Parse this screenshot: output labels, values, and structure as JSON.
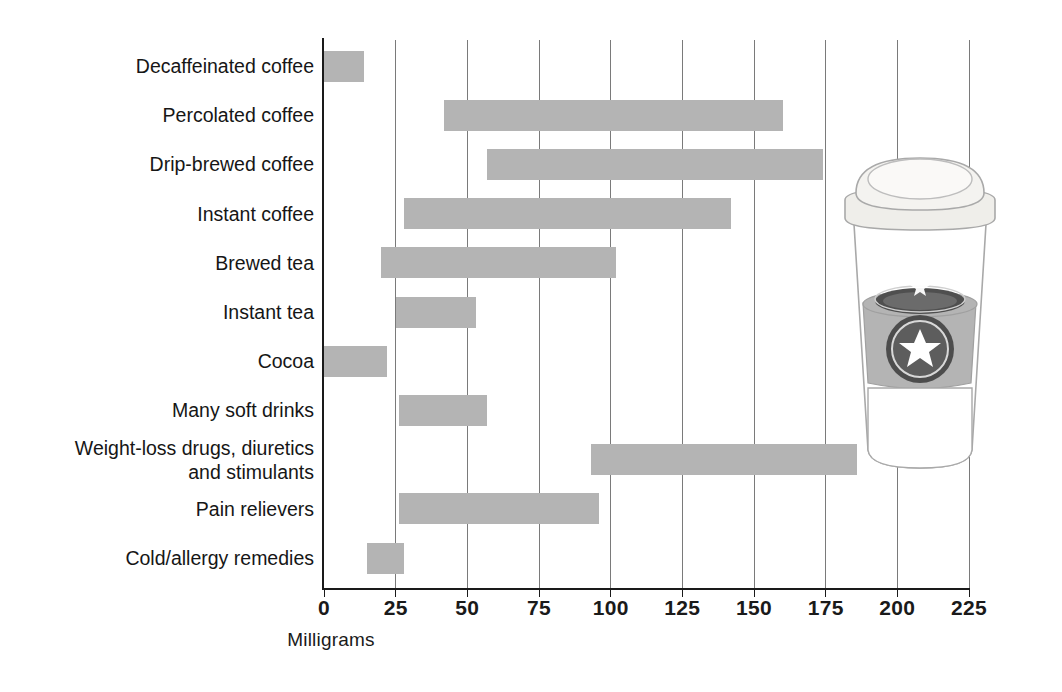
{
  "chart_data": {
    "type": "bar",
    "orientation": "horizontal",
    "subtype": "range-bar",
    "title": "",
    "xlabel": "Milligrams",
    "ylabel": "",
    "xlim": [
      0,
      232
    ],
    "xticks": [
      0,
      25,
      50,
      75,
      100,
      125,
      150,
      175,
      200,
      225
    ],
    "xtick_labels": [
      "0",
      "25",
      "50",
      "75",
      "100",
      "125",
      "150",
      "175",
      "200",
      "225"
    ],
    "grid": "vertical",
    "legend": "none",
    "bar_color": "#b4b4b4",
    "axis_color": "#1a1a1a",
    "grid_color": "#7a7a7a",
    "categories": [
      "Decaffeinated coffee",
      "Percolated coffee",
      "Drip-brewed coffee",
      "Instant coffee",
      "Brewed tea",
      "Instant tea",
      "Cocoa",
      "Many soft drinks",
      "Weight-loss drugs, diuretics\nand stimulants",
      "Pain relievers",
      "Cold/allergy remedies"
    ],
    "ranges": [
      {
        "label": "Decaffeinated coffee",
        "low": 0,
        "high": 14
      },
      {
        "label": "Percolated coffee",
        "low": 42,
        "high": 160
      },
      {
        "label": "Drip-brewed coffee",
        "low": 57,
        "high": 174
      },
      {
        "label": "Instant coffee",
        "low": 28,
        "high": 142
      },
      {
        "label": "Brewed tea",
        "low": 20,
        "high": 102
      },
      {
        "label": "Instant tea",
        "low": 25,
        "high": 53
      },
      {
        "label": "Cocoa",
        "low": 0,
        "high": 22
      },
      {
        "label": "Many soft drinks",
        "low": 26,
        "high": 57
      },
      {
        "label": "Weight-loss drugs, diuretics and stimulants",
        "low": 93,
        "high": 186
      },
      {
        "label": "Pain relievers",
        "low": 26,
        "high": 96
      },
      {
        "label": "Cold/allergy remedies",
        "low": 15,
        "high": 28
      }
    ]
  },
  "illustration": {
    "name": "takeout-coffee-cup",
    "cup_body_color": "#ffffff",
    "lid_color": "#f2f0ed",
    "sleeve_color": "#b4b4b4",
    "logo_color": "#4d4d4d",
    "star_color": "#ffffff",
    "outline_color": "#9a9a9a"
  }
}
